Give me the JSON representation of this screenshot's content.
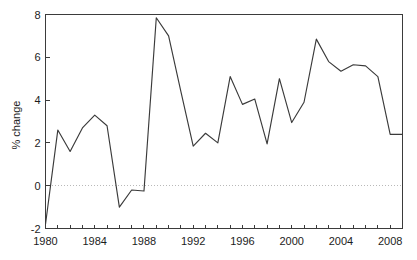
{
  "chart_data": {
    "type": "line",
    "title": "",
    "subtitle": "",
    "xlabel": "",
    "ylabel": "% change",
    "xlim": [
      1980,
      2009
    ],
    "ylim": [
      -2,
      8
    ],
    "grid": false,
    "legend": null,
    "zero_reference_line": 0,
    "x_tick_labels": [
      "1980",
      "1984",
      "1988",
      "1992",
      "1996",
      "2000",
      "2004",
      "2008"
    ],
    "x_tick_values": [
      1980,
      1984,
      1988,
      1992,
      1996,
      2000,
      2004,
      2008
    ],
    "x_minor_tick_values": [
      1980,
      1981,
      1982,
      1983,
      1984,
      1985,
      1986,
      1987,
      1988,
      1989,
      1990,
      1991,
      1992,
      1993,
      1994,
      1995,
      1996,
      1997,
      1998,
      1999,
      2000,
      2001,
      2002,
      2003,
      2004,
      2005,
      2006,
      2007,
      2008,
      2009
    ],
    "y_tick_labels": [
      "-2",
      "0",
      "2",
      "4",
      "6",
      "8"
    ],
    "y_tick_values": [
      -2,
      0,
      2,
      4,
      6,
      8
    ],
    "series": [
      {
        "name": "% change",
        "color": "#3a3a3a",
        "x": [
          1980,
          1981,
          1982,
          1983,
          1984,
          1985,
          1986,
          1987,
          1988,
          1989,
          1990,
          1991,
          1992,
          1993,
          1994,
          1995,
          1996,
          1997,
          1998,
          1999,
          2000,
          2001,
          2002,
          2003,
          2004,
          2005,
          2006,
          2007,
          2008,
          2009
        ],
        "values": [
          -1.8,
          2.6,
          1.6,
          2.7,
          3.3,
          2.8,
          -1.0,
          -0.2,
          -0.25,
          7.85,
          7.0,
          4.4,
          1.85,
          2.45,
          2.0,
          5.1,
          3.8,
          4.05,
          1.95,
          5.0,
          2.95,
          3.9,
          6.85,
          5.8,
          5.35,
          5.65,
          5.6,
          5.1,
          2.4,
          2.4
        ]
      }
    ]
  },
  "axes": {
    "y_title": "% change"
  },
  "colors": {
    "line": "#3a3a3a",
    "axis": "#3b3b3b",
    "zero_line": "#b9b9b9",
    "background": "#ffffff",
    "text": "#1c1c1c"
  }
}
